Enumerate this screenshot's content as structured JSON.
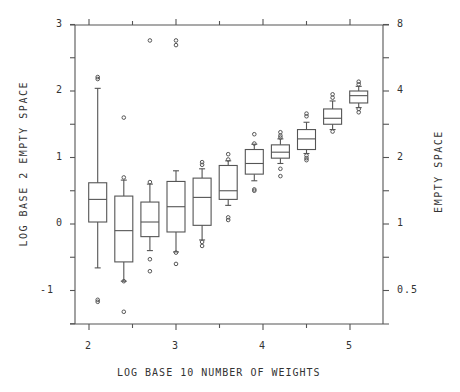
{
  "chart_data": {
    "type": "box",
    "title": "",
    "xlabel": "LOG BASE 10 NUMBER OF WEIGHTS",
    "ylabel": "LOG BASE 2 EMPTY SPACE",
    "ylabel_right": "EMPTY SPACE",
    "xlim": [
      1.9,
      5.45
    ],
    "ylim": [
      -1.5,
      3
    ],
    "x_ticks": [
      2,
      2.5,
      3,
      3.5,
      4,
      4.5,
      5
    ],
    "x_tick_labels": [
      "2",
      "",
      "3",
      "",
      "4",
      "",
      "5"
    ],
    "y_ticks": [
      -1.5,
      -1,
      -0.5,
      0,
      0.5,
      1,
      1.5,
      2,
      2.5,
      3
    ],
    "y_tick_labels": [
      "",
      "-1",
      "",
      "0",
      "",
      "1",
      "",
      "2",
      "",
      "3"
    ],
    "y_right_ticks": [
      -1,
      -0.5,
      0,
      0.5,
      1,
      1.5,
      2,
      2.5,
      3
    ],
    "y_right_tick_labels": [
      "0.5",
      "",
      "1",
      "",
      "2",
      "",
      "4",
      "",
      "8"
    ],
    "grid": false,
    "legend": null,
    "boxes": [
      {
        "x": 2.1,
        "whisker_low": -0.66,
        "q1": 0.03,
        "median": 0.37,
        "q3": 0.62,
        "whisker_high": 2.04,
        "outliers": [
          2.21,
          2.18,
          -1.14,
          -1.17
        ]
      },
      {
        "x": 2.4,
        "whisker_low": -0.86,
        "q1": -0.57,
        "median": -0.1,
        "q3": 0.42,
        "whisker_high": 0.66,
        "outliers": [
          1.6,
          0.7,
          -0.86,
          -1.32
        ]
      },
      {
        "x": 2.7,
        "whisker_low": -0.4,
        "q1": -0.19,
        "median": 0.03,
        "q3": 0.33,
        "whisker_high": 0.6,
        "outliers": [
          2.76,
          0.63,
          -0.53,
          -0.71
        ]
      },
      {
        "x": 3.0,
        "whisker_low": -0.42,
        "q1": -0.12,
        "median": 0.26,
        "q3": 0.64,
        "whisker_high": 0.8,
        "outliers": [
          2.76,
          2.69,
          -0.43,
          -0.6
        ]
      },
      {
        "x": 3.3,
        "whisker_low": -0.24,
        "q1": -0.02,
        "median": 0.4,
        "q3": 0.69,
        "whisker_high": 0.83,
        "outliers": [
          0.93,
          0.89,
          -0.27,
          -0.33
        ]
      },
      {
        "x": 3.6,
        "whisker_low": 0.28,
        "q1": 0.37,
        "median": 0.5,
        "q3": 0.88,
        "whisker_high": 0.95,
        "outliers": [
          1.05,
          0.97,
          0.1,
          0.06
        ]
      },
      {
        "x": 3.9,
        "whisker_low": 0.65,
        "q1": 0.75,
        "median": 0.91,
        "q3": 1.12,
        "whisker_high": 1.2,
        "outliers": [
          1.35,
          1.21,
          0.52,
          0.5
        ]
      },
      {
        "x": 4.2,
        "whisker_low": 0.91,
        "q1": 0.99,
        "median": 1.08,
        "q3": 1.19,
        "whisker_high": 1.28,
        "outliers": [
          1.38,
          1.33,
          1.3,
          0.83,
          0.72
        ]
      },
      {
        "x": 4.5,
        "whisker_low": 1.06,
        "q1": 1.12,
        "median": 1.28,
        "q3": 1.42,
        "whisker_high": 1.53,
        "outliers": [
          1.66,
          1.62,
          1.03,
          0.99,
          0.96
        ]
      },
      {
        "x": 4.8,
        "whisker_low": 1.42,
        "q1": 1.5,
        "median": 1.59,
        "q3": 1.73,
        "whisker_high": 1.85,
        "outliers": [
          1.95,
          1.9,
          1.39
        ]
      },
      {
        "x": 5.1,
        "whisker_low": 1.75,
        "q1": 1.82,
        "median": 1.93,
        "q3": 2.0,
        "whisker_high": 2.07,
        "outliers": [
          2.14,
          2.1,
          1.73,
          1.68
        ]
      }
    ],
    "colors": {
      "line": "#555555",
      "background": "#ffffff"
    }
  }
}
